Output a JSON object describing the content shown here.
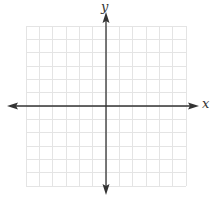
{
  "diagram": {
    "type": "cartesian-coordinate-plane",
    "axes": {
      "x_label": "x",
      "y_label": "y",
      "arrows": [
        "left",
        "right",
        "up",
        "down"
      ]
    },
    "grid": {
      "columns": 12,
      "rows": 12,
      "columns_left_of_y_axis": 6,
      "columns_right_of_y_axis": 6,
      "rows_above_x_axis": 6,
      "rows_below_x_axis": 6,
      "numeric_tick_labels": false
    },
    "colors": {
      "grid_line": "#e4e4e4",
      "axis_line": "#333333",
      "background": "#ffffff"
    }
  }
}
